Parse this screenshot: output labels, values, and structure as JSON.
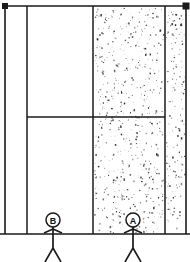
{
  "diagram": {
    "background_color": "#ffffff",
    "line_color": "#1a1a1a",
    "stipple_color": "#2b2b2b",
    "canvas": {
      "width": 190,
      "height": 262
    },
    "geometry": {
      "top_rail_y": 6,
      "ground_y": 234,
      "left_border_x": 5,
      "right_border_x": 186,
      "inner_left_wall_x": 27,
      "mid_wall_x": 93,
      "right_wall_x": 165,
      "horizontal_divider_y": 117,
      "horizontal_divider_x_start": 27,
      "horizontal_divider_x_end": 165
    },
    "end_markers": [
      {
        "name": "top-left-node",
        "cx": 5,
        "cy": 6,
        "size": 6
      },
      {
        "name": "top-right-node",
        "cx": 186,
        "cy": 6,
        "size": 7
      }
    ],
    "regions": [
      {
        "name": "upper-left-blank-bay",
        "fill": "blank",
        "x": 27,
        "y": 6,
        "width": 66,
        "height": 111
      },
      {
        "name": "lower-left-blank-bay",
        "fill": "blank",
        "x": 27,
        "y": 117,
        "width": 66,
        "height": 117
      },
      {
        "name": "left-margin-strip",
        "fill": "blank",
        "x": 5,
        "y": 6,
        "width": 22,
        "height": 228
      },
      {
        "name": "central-stippled-bay",
        "fill": "stipple",
        "x": 93,
        "y": 6,
        "width": 72,
        "height": 228
      },
      {
        "name": "right-stippled-strip",
        "fill": "stipple",
        "x": 165,
        "y": 6,
        "width": 21,
        "height": 228
      }
    ],
    "stipple": {
      "dot_count": 760,
      "min_dot_px": 0.5,
      "max_dot_px": 1.7,
      "seed": 20240517
    },
    "figures": [
      {
        "name": "figure-a",
        "label": "A",
        "head_cx": 133,
        "head_cy": 220,
        "head_r": 7,
        "body_top_y": 227,
        "body_bottom_y": 248,
        "arm_y": 231,
        "arm_span": 9,
        "leg_spread": 8,
        "leg_bottom_y": 262
      },
      {
        "name": "figure-b",
        "label": "B",
        "head_cx": 53,
        "head_cy": 220,
        "head_r": 7,
        "body_top_y": 227,
        "body_bottom_y": 248,
        "arm_y": 231,
        "arm_span": 9,
        "leg_spread": 8,
        "leg_bottom_y": 262
      }
    ]
  }
}
